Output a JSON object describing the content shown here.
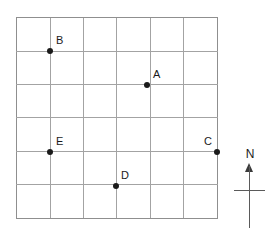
{
  "figure": {
    "type": "grid-map-diagram",
    "background_color": "#ffffff",
    "grid": {
      "columns": 6,
      "rows": 6,
      "line_color": "#a3a3a3",
      "border_color": "#8f8f8f",
      "left_px": 16,
      "top_px": 17,
      "width_px": 202,
      "height_px": 202,
      "cell_size_px": 33.67,
      "vertical_line_x": [
        0,
        33.67,
        67.33,
        100,
        133.67,
        167.33,
        201
      ],
      "horizontal_line_y": [
        0,
        33.67,
        67.33,
        100,
        133.67,
        167.33,
        201
      ]
    },
    "points": [
      {
        "id": "point-a",
        "label": "A",
        "grid_col": 4,
        "grid_row": 2,
        "x_px": 147,
        "y_px": 85,
        "label_dx": 6,
        "label_dy": -16,
        "color": "#1a1a1a"
      },
      {
        "id": "point-b",
        "label": "B",
        "grid_col": 1,
        "grid_row": 1,
        "x_px": 50,
        "y_px": 51,
        "label_dx": 6,
        "label_dy": -16,
        "color": "#1a1a1a"
      },
      {
        "id": "point-c",
        "label": "C",
        "grid_col": 6,
        "grid_row": 4,
        "x_px": 217,
        "y_px": 152,
        "label_dx": -13,
        "label_dy": -16,
        "color": "#1a1a1a"
      },
      {
        "id": "point-d",
        "label": "D",
        "grid_col": 3,
        "grid_row": 5,
        "x_px": 116,
        "y_px": 186,
        "label_dx": 5,
        "label_dy": -16,
        "color": "#1a1a1a"
      },
      {
        "id": "point-e",
        "label": "E",
        "grid_col": 1,
        "grid_row": 4,
        "x_px": 50,
        "y_px": 152,
        "label_dx": 6,
        "label_dy": -16,
        "color": "#1a1a1a"
      }
    ],
    "compass": {
      "label": "N",
      "icon": "north-arrow-icon",
      "shaft_color": "#5a5a5a",
      "head_color": "#3a3a3a"
    }
  }
}
